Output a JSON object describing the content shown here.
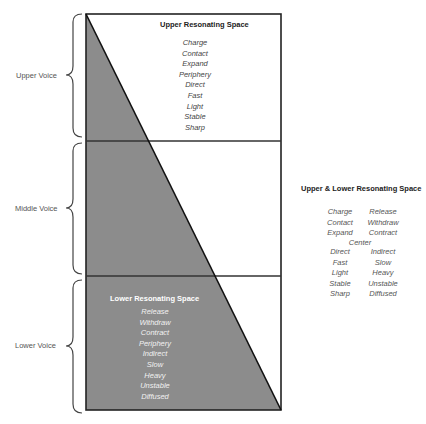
{
  "voices": [
    {
      "label": "Upper Voice"
    },
    {
      "label": "Middle Voice"
    },
    {
      "label": "Lower Voice"
    }
  ],
  "upper_space": {
    "title": "Upper Resonating Space",
    "items": [
      "Charge",
      "Contact",
      "Expand",
      "Periphery",
      "Direct",
      "Fast",
      "Light",
      "Stable",
      "Sharp"
    ]
  },
  "lower_space": {
    "title": "Lower Resonating Space",
    "items": [
      "Release",
      "Withdraw",
      "Contract",
      "Periphery",
      "Indirect",
      "Slow",
      "Heavy",
      "Unstable",
      "Diffused"
    ]
  },
  "combined_space": {
    "title": "Upper & Lower Resonating Space",
    "left": [
      "Charge",
      "Contact",
      "Expand"
    ],
    "right": [
      "Release",
      "Withdraw",
      "Contract"
    ],
    "center": "Center",
    "left2": [
      "Direct",
      "Fast",
      "Light",
      "Stable",
      "Sharp"
    ],
    "right2": [
      "Indirect",
      "Slow",
      "Heavy",
      "Unstable",
      "Diffused"
    ]
  },
  "colors": {
    "fill": "#8c8c8c",
    "stroke": "#222222"
  }
}
